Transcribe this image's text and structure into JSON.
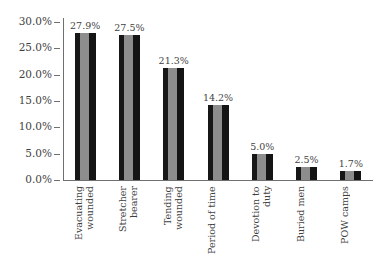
{
  "chart_data": {
    "type": "bar",
    "title": "",
    "xlabel": "",
    "ylabel": "",
    "ylim": [
      0,
      30
    ],
    "grid": false,
    "legend": "none",
    "orientation": "vertical",
    "value_label_format": "percent-one-decimal",
    "categories": [
      "Evacuating\nwounded",
      "Stretcher bearer",
      "Tending\nwounded",
      "Period of time",
      "Devotion to duty",
      "Buried men",
      "POW camps"
    ],
    "values": [
      27.9,
      27.5,
      21.3,
      14.2,
      5.0,
      2.5,
      1.7
    ],
    "value_labels": [
      "27.9%",
      "27.5%",
      "21.3%",
      "14.2%",
      "5.0%",
      "2.5%",
      "1.7%"
    ],
    "y_ticks": [
      30,
      25,
      20,
      15,
      10,
      5,
      0
    ],
    "y_tick_labels": [
      "30.0%",
      "25.0%",
      "20.0%",
      "15.0%",
      "10.0%",
      "5.0%",
      "0.0%"
    ],
    "colors": {
      "bar_dark": "#171717",
      "bar_light": "#8d8d8d",
      "axis": "#6f6f6f",
      "text": "#3f3f3f",
      "background": "#ffffff"
    }
  }
}
